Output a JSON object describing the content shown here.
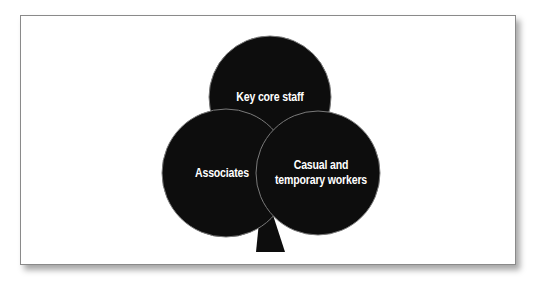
{
  "diagram": {
    "type": "overlapping-circles-tree",
    "colors": {
      "fill": "#0d0d0d",
      "outline": "#7a7a7a",
      "text": "#ffffff",
      "background": "#ffffff",
      "frame_border": "#8a8a8a"
    },
    "circles": [
      {
        "id": "top",
        "label": "Key core staff"
      },
      {
        "id": "left",
        "label": "Associates"
      },
      {
        "id": "right",
        "label_line1": "Casual and",
        "label_line2": "temporary workers"
      }
    ]
  }
}
